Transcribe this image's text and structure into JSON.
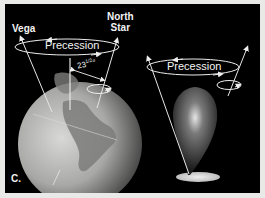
{
  "figure": {
    "panel_label": "C.",
    "left": {
      "star_left": "Vega",
      "star_right_line1": "North",
      "star_right_line2": "Star",
      "precession_label": "Precession",
      "tilt_angle": "23",
      "tilt_fraction": "1/2",
      "tilt_unit": "°"
    },
    "right": {
      "precession_label": "Precession"
    }
  },
  "colors": {
    "background": "#000000",
    "border": "#e9e9e7",
    "text": "#f2f2f2"
  }
}
